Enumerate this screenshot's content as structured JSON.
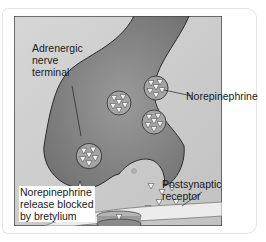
{
  "diagram": {
    "labels": {
      "terminal_line1": "Adrenergic",
      "terminal_line2": "nerve",
      "terminal_line3": "terminal",
      "vesicle": "Norepinephrine",
      "blocked_line1": "Norepinephrine",
      "blocked_line2": "release blocked",
      "blocked_line3": "by bretylium",
      "receptor_line1": "Postsynaptic",
      "receptor_line2": "receptor"
    },
    "colors": {
      "background_panel": "#c9c9c9",
      "terminal_fill": "#8f8f8f",
      "outline": "#2a2a2a",
      "vesicle_fill": "#a8a8a8",
      "neurotransmitter": "#f2f2f2",
      "membrane": "#e8e8e8"
    }
  }
}
